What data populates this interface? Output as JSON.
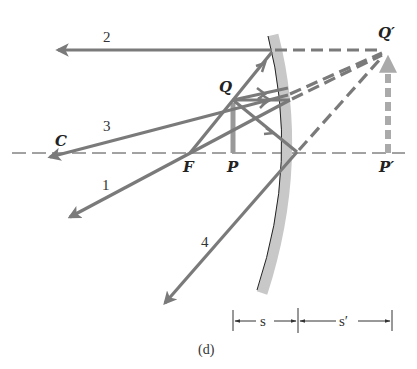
{
  "figure": {
    "caption": "(d)",
    "colors": {
      "ray": "#7a7a7a",
      "mirror_band": "#c8c8c8",
      "mirror_surface": "#222222",
      "axis": "#444444",
      "image_arrow": "#aaaaaa",
      "background": "#ffffff"
    },
    "points": {
      "C": "C",
      "F": "F",
      "P": "P",
      "Q": "Q",
      "P_prime": "P′",
      "Q_prime": "Q′"
    },
    "rays": [
      {
        "id": "1",
        "label": "1",
        "description": "parallel to axis, reflects through F"
      },
      {
        "id": "2",
        "label": "2",
        "description": "through F, reflects parallel to axis"
      },
      {
        "id": "3",
        "label": "3",
        "description": "along line from C, reflects back through C"
      },
      {
        "id": "4",
        "label": "4",
        "description": "to vertex, reflects symmetrically"
      }
    ],
    "dimensions": {
      "object_distance": "s",
      "image_distance": "s′"
    }
  }
}
